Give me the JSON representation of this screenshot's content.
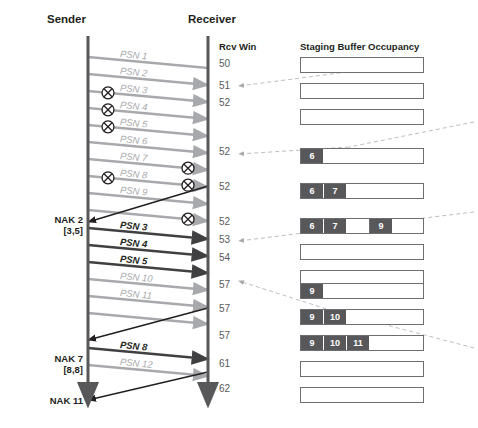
{
  "headers": {
    "sender": "Sender",
    "receiver": "Receiver",
    "rcv_win": "Rcv Win",
    "staging": "Staging Buffer Occupancy"
  },
  "colors": {
    "lost_packet": "#a7a9ac",
    "retransmit_packet": "#404042",
    "nak_arrow": "#231f20",
    "lifeline": "#58585a",
    "buffer_border": "#6d6e71",
    "slot_fill": "#58585a",
    "slot_text": "#ffffff",
    "dashed_guide": "#bcbec0",
    "text": "#231f20"
  },
  "messages": [
    {
      "label": "PSN 1",
      "y0": 57,
      "y1": 68,
      "state": "lost",
      "drop_at": "none",
      "arrowhead": false
    },
    {
      "label": "PSN 2",
      "y0": 74,
      "y1": 85,
      "state": "lost",
      "drop_at": "none",
      "arrowhead": true
    },
    {
      "label": "PSN 3",
      "y0": 91,
      "y1": 102,
      "state": "lost",
      "drop_at": "sender",
      "arrowhead": true
    },
    {
      "label": "PSN 4",
      "y0": 108,
      "y1": 119,
      "state": "lost",
      "drop_at": "sender",
      "arrowhead": true
    },
    {
      "label": "PSN 5",
      "y0": 125,
      "y1": 136,
      "state": "lost",
      "drop_at": "sender",
      "arrowhead": true
    },
    {
      "label": "PSN 6",
      "y0": 142,
      "y1": 153,
      "state": "lost",
      "drop_at": "none",
      "arrowhead": true
    },
    {
      "label": "PSN 7",
      "y0": 159,
      "y1": 170,
      "state": "lost",
      "drop_at": "receiver",
      "arrowhead": true
    },
    {
      "label": "PSN 8",
      "y0": 176,
      "y1": 187,
      "state": "lost",
      "drop_at": "both",
      "arrowhead": true
    },
    {
      "label": "PSN 9",
      "y0": 193,
      "y1": 204,
      "state": "lost",
      "drop_at": "none",
      "arrowhead": true
    },
    {
      "label": "PSN 9b",
      "y0": 210,
      "y1": 221,
      "state": "lost",
      "drop_at": "receiver",
      "arrowhead": true,
      "hide_label": true
    },
    {
      "label": "PSN 3",
      "y0": 228,
      "y1": 239,
      "state": "retransmit",
      "drop_at": "none",
      "arrowhead": true
    },
    {
      "label": "PSN 4",
      "y0": 245,
      "y1": 256,
      "state": "retransmit",
      "drop_at": "none",
      "arrowhead": true
    },
    {
      "label": "PSN 5",
      "y0": 262,
      "y1": 273,
      "state": "retransmit",
      "drop_at": "none",
      "arrowhead": true
    },
    {
      "label": "PSN 10",
      "y0": 279,
      "y1": 290,
      "state": "lost",
      "drop_at": "none",
      "arrowhead": true
    },
    {
      "label": "PSN 11",
      "y0": 296,
      "y1": 307,
      "state": "lost",
      "drop_at": "none",
      "arrowhead": true
    },
    {
      "label": "PSN 11b",
      "y0": 313,
      "y1": 324,
      "state": "lost",
      "drop_at": "none",
      "arrowhead": true,
      "hide_label": true
    },
    {
      "label": "PSN 8",
      "y0": 348,
      "y1": 359,
      "state": "retransmit",
      "drop_at": "none",
      "arrowhead": true
    },
    {
      "label": "PSN 12",
      "y0": 365,
      "y1": 376,
      "state": "lost",
      "drop_at": "none",
      "arrowhead": true
    }
  ],
  "naks": [
    {
      "label": "NAK 2",
      "range": "[3,5]",
      "y_receiver": 186,
      "y_sender": 222,
      "label_y": 214
    },
    {
      "label": "NAK 7",
      "range": "[8,8]",
      "y_receiver": 308,
      "y_sender": 340,
      "label_y": 353
    },
    {
      "label": "NAK 11",
      "range": "",
      "y_receiver": 372,
      "y_sender": 400,
      "label_y": 395
    }
  ],
  "rcv_win_values": [
    {
      "value": "50",
      "y": 64
    },
    {
      "value": "51",
      "y": 86
    },
    {
      "value": "52",
      "y": 103
    },
    {
      "value": "52",
      "y": 152
    },
    {
      "value": "52",
      "y": 187
    },
    {
      "value": "52",
      "y": 222
    },
    {
      "value": "53",
      "y": 240
    },
    {
      "value": "54",
      "y": 258
    },
    {
      "value": "57",
      "y": 285
    },
    {
      "value": "57",
      "y": 309
    },
    {
      "value": "57",
      "y": 336
    },
    {
      "value": "61",
      "y": 364
    },
    {
      "value": "62",
      "y": 389
    }
  ],
  "staging_buffers": [
    {
      "y": 57,
      "slots": []
    },
    {
      "y": 83,
      "slots": []
    },
    {
      "y": 109,
      "slots": []
    },
    {
      "y": 148,
      "slots": [
        {
          "label": "6",
          "filled": true
        }
      ]
    },
    {
      "y": 183,
      "slots": [
        {
          "label": "6",
          "filled": true
        },
        {
          "label": "7",
          "filled": true
        }
      ]
    },
    {
      "y": 218,
      "slots": [
        {
          "label": "6",
          "filled": true
        },
        {
          "label": "7",
          "filled": true
        },
        {
          "label": "",
          "filled": false
        },
        {
          "label": "9",
          "filled": true
        }
      ]
    },
    {
      "y": 244,
      "slots": []
    },
    {
      "y": 270,
      "slots": []
    },
    {
      "y": 281,
      "slots": [
        {
          "label": "9",
          "filled": true
        }
      ],
      "hidden": true
    },
    {
      "y": 283,
      "slots": [
        {
          "label": "9",
          "filled": true
        }
      ]
    },
    {
      "y": 309,
      "slots": [
        {
          "label": "9",
          "filled": true
        },
        {
          "label": "10",
          "filled": true
        }
      ]
    },
    {
      "y": 335,
      "slots": [
        {
          "label": "9",
          "filled": true
        },
        {
          "label": "10",
          "filled": true
        },
        {
          "label": "11",
          "filled": true
        }
      ]
    },
    {
      "y": 361,
      "slots": []
    },
    {
      "y": 387,
      "slots": []
    }
  ],
  "guides": [
    {
      "from_x": 424,
      "from_y": 62,
      "to_x": 239,
      "to_y": 86
    },
    {
      "from_x": 474,
      "from_y": 122,
      "to_x": 349,
      "to_y": 147
    },
    {
      "from_x": 349,
      "from_y": 147,
      "to_x": 239,
      "to_y": 154
    },
    {
      "from_x": 474,
      "from_y": 212,
      "to_x": 383,
      "to_y": 223
    },
    {
      "from_x": 383,
      "from_y": 223,
      "to_x": 239,
      "to_y": 241
    },
    {
      "from_x": 474,
      "from_y": 348,
      "to_x": 333,
      "to_y": 311
    },
    {
      "from_x": 333,
      "from_y": 311,
      "to_x": 239,
      "to_y": 281
    }
  ],
  "geometry": {
    "sender_x": 88,
    "receiver_x": 208,
    "buffer_left": 300,
    "buffer_right": 424,
    "buffer_height": 16,
    "slot_width": 23
  }
}
